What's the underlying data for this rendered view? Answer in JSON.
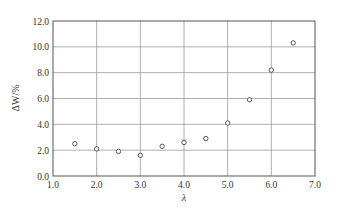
{
  "chart_data": {
    "type": "scatter",
    "title": "",
    "xlabel": "λ",
    "ylabel": "ΔW/%",
    "xlim": [
      1.0,
      7.0
    ],
    "ylim": [
      0.0,
      12.0
    ],
    "xticks": [
      "1.0",
      "2.0",
      "3.0",
      "4.0",
      "5.0",
      "6.0",
      "7.0"
    ],
    "yticks": [
      "0.0",
      "2.0",
      "4.0",
      "6.0",
      "8.0",
      "10.0",
      "12.0"
    ],
    "grid": true,
    "legend": null,
    "marker": "open-circle",
    "series": [
      {
        "name": "ΔW",
        "x": [
          1.5,
          2.0,
          2.5,
          3.0,
          3.5,
          4.0,
          4.5,
          5.0,
          5.5,
          6.0,
          6.5
        ],
        "y": [
          2.5,
          2.1,
          1.9,
          1.6,
          2.3,
          2.6,
          2.9,
          4.1,
          5.9,
          8.2,
          10.3
        ]
      }
    ]
  },
  "colors": {
    "frame": "#555555",
    "grid": "#9a9a9a",
    "marker": "#555555",
    "text": "#333333"
  }
}
